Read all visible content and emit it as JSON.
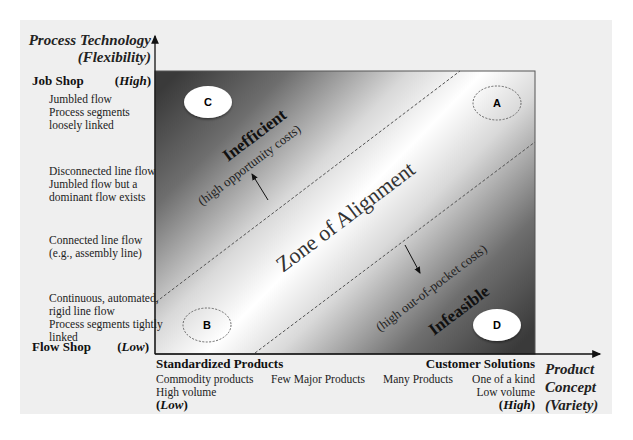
{
  "y_axis": {
    "title_line1": "Process Technology",
    "title_line2": "(Flexibility)",
    "top_label": "Job Shop",
    "top_level": "High",
    "bottom_label": "Flow Shop",
    "bottom_level": "Low",
    "stages": [
      {
        "lines": [
          "Jumbled flow",
          "Process segments",
          "loosely linked"
        ]
      },
      {
        "lines": [
          "Disconnected line flow",
          "Jumbled flow but a",
          "dominant flow exists"
        ]
      },
      {
        "lines": [
          "Connected line flow",
          "(e.g., assembly line)"
        ]
      },
      {
        "lines": [
          "Continuous, automated,",
          "rigid line flow",
          "Process segments tightly",
          "linked"
        ]
      }
    ]
  },
  "x_axis": {
    "title_line1": "Product",
    "title_line2": "Concept",
    "title_line3": "(Variety)",
    "left_label": "Standardized Products",
    "left_level": "Low",
    "right_label": "Customer Solutions",
    "right_level": "High",
    "stages": [
      {
        "lines": [
          "Commodity products",
          "High volume"
        ]
      },
      {
        "lines": [
          "Few Major Products"
        ]
      },
      {
        "lines": [
          "Many Products"
        ]
      },
      {
        "lines": [
          "One of a kind",
          "Low volume"
        ]
      }
    ]
  },
  "chart": {
    "zone_label": "Zone of Alignment",
    "upper_region_label": "Inefficient",
    "upper_region_note": "(high opportunity costs)",
    "lower_region_label": "Infeasible",
    "lower_region_note": "(high out-of-pocket costs)",
    "points": [
      {
        "id": "A",
        "style": "dashed"
      },
      {
        "id": "B",
        "style": "dashed"
      },
      {
        "id": "C",
        "style": "filled"
      },
      {
        "id": "D",
        "style": "filled"
      }
    ]
  },
  "colors": {
    "panel_bg": "#efefef",
    "dark_corner": "#3a3a3a",
    "zone_center": "#ffffff"
  }
}
